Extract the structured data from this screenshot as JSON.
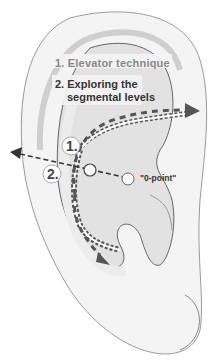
{
  "figure": {
    "labels": {
      "technique_1": "1. Elevator technique",
      "technique_2_line1": "2. Exploring the",
      "technique_2_line2": "segmental levels",
      "zero_point": "\"0-point\"",
      "marker_1": "1.",
      "marker_2": "2."
    },
    "colors": {
      "ear_fill": "#f4f4f4",
      "concha_fill": "#e2e2e2",
      "outline": "#777777",
      "arrow": "#555555",
      "text_grey": "#888888",
      "text_dark": "#333333"
    }
  }
}
